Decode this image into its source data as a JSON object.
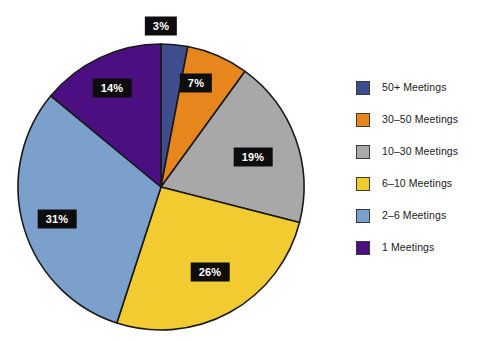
{
  "chart_data": {
    "type": "pie",
    "title": "",
    "subtitle": "",
    "xlabel": "",
    "ylabel": "",
    "grid": false,
    "legend_position": "right",
    "start_angle_deg": 0,
    "direction": "clockwise",
    "categories": [
      "50+ Meetings",
      "30–50 Meetings",
      "10–30 Meetings",
      "6–10 Meetings",
      "2–6 Meetings",
      "1 Meetings"
    ],
    "values": [
      3,
      7,
      19,
      26,
      31,
      14
    ],
    "value_labels": [
      "3%",
      "7%",
      "19%",
      "26%",
      "31%",
      "14%"
    ],
    "colors": [
      "#3F4D8C",
      "#E8861E",
      "#A8A8A8",
      "#F2CB30",
      "#7BA0CC",
      "#4B0F82"
    ],
    "slice_border_color": "#1a1a1a",
    "label_text_color": "#ffffff",
    "label_background_color": "#0d0d0d"
  },
  "legend": {
    "items": [
      {
        "label": "50+ Meetings",
        "color": "#3F4D8C"
      },
      {
        "label": "30–50 Meetings",
        "color": "#E8861E"
      },
      {
        "label": "10–30 Meetings",
        "color": "#A8A8A8"
      },
      {
        "label": "6–10 Meetings",
        "color": "#F2CB30"
      },
      {
        "label": "2–6 Meetings",
        "color": "#7BA0CC"
      },
      {
        "label": "1 Meetings",
        "color": "#4B0F82"
      }
    ]
  },
  "pie_geometry": {
    "center_x": 161,
    "center_y": 187,
    "radius": 143,
    "label_positions": [
      {
        "x": 161,
        "y": 26
      },
      {
        "x": 196,
        "y": 83
      },
      {
        "x": 253,
        "y": 157
      },
      {
        "x": 210,
        "y": 272
      },
      {
        "x": 57,
        "y": 219
      },
      {
        "x": 112,
        "y": 88
      }
    ]
  }
}
